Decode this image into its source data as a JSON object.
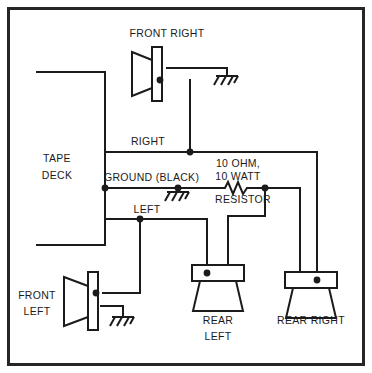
{
  "diagram": {
    "source_label": {
      "line1": "TAPE",
      "line2": "DECK"
    },
    "wire_labels": {
      "right": "RIGHT",
      "ground": "GROUND (BLACK)",
      "left": "LEFT"
    },
    "resistor": {
      "line1": "10 OHM,",
      "line2": "10 WATT",
      "line3": "RESISTOR"
    },
    "speakers": [
      {
        "id": "front-right",
        "label": "FRONT RIGHT",
        "label_line1": "FRONT RIGHT",
        "label_line2": ""
      },
      {
        "id": "front-left",
        "label": "FRONT LEFT",
        "label_line1": "FRONT",
        "label_line2": "LEFT"
      },
      {
        "id": "rear-left",
        "label": "REAR LEFT",
        "label_line1": "REAR",
        "label_line2": "LEFT"
      },
      {
        "id": "rear-right",
        "label": "REAR RIGHT",
        "label_line1": "REAR RIGHT",
        "label_line2": ""
      }
    ],
    "colors": {
      "ink": "#1b1b1b",
      "frame": "#262626",
      "background": "#ffffff"
    }
  }
}
